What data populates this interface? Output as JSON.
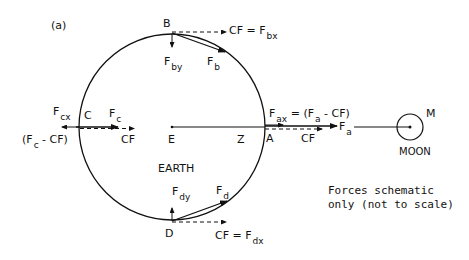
{
  "panel_label": "(a)",
  "earth": {
    "label": "EARTH",
    "center_label": "E",
    "point_z": "Z"
  },
  "moon": {
    "label": "MOON",
    "point_label": "M"
  },
  "points": {
    "A": "A",
    "B": "B",
    "C": "C",
    "D": "D"
  },
  "forces": {
    "b": {
      "main": "F",
      "main_sub": "b",
      "y": "F",
      "y_sub": "by",
      "cf": "CF = F",
      "cf_sub": "bx"
    },
    "c": {
      "main": "F",
      "main_sub": "c",
      "x": "F",
      "x_sub": "cx",
      "x_expr_a": "(F",
      "x_expr_sub": "c",
      "x_expr_b": " - CF)",
      "cf": "CF"
    },
    "a": {
      "x": "F",
      "x_sub": "ax",
      "x_eq_a": " = (F",
      "x_eq_sub": "a",
      "x_eq_b": " - CF)",
      "main": "F",
      "main_sub": "a",
      "cf": "CF"
    },
    "d": {
      "main": "F",
      "main_sub": "d",
      "y": "F",
      "y_sub": "dy",
      "cf": "CF = F",
      "cf_sub": "dx"
    }
  },
  "note": {
    "line1": "Forces schematic",
    "line2": "only (not to scale)"
  },
  "colors": {
    "ink": "#111111",
    "background": "#ffffff"
  }
}
